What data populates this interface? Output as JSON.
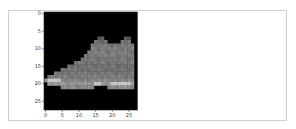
{
  "output_cell": {
    "type": "matplotlib-imshow-output"
  },
  "image": {
    "subject": "ankle boot",
    "colormap": "gray",
    "shape": [
      28,
      28
    ]
  },
  "axes": {
    "y_ticks": [
      "0",
      "5",
      "10",
      "15",
      "20",
      "25"
    ],
    "x_ticks": [
      "0",
      "5",
      "10",
      "15",
      "20",
      "25"
    ]
  }
}
